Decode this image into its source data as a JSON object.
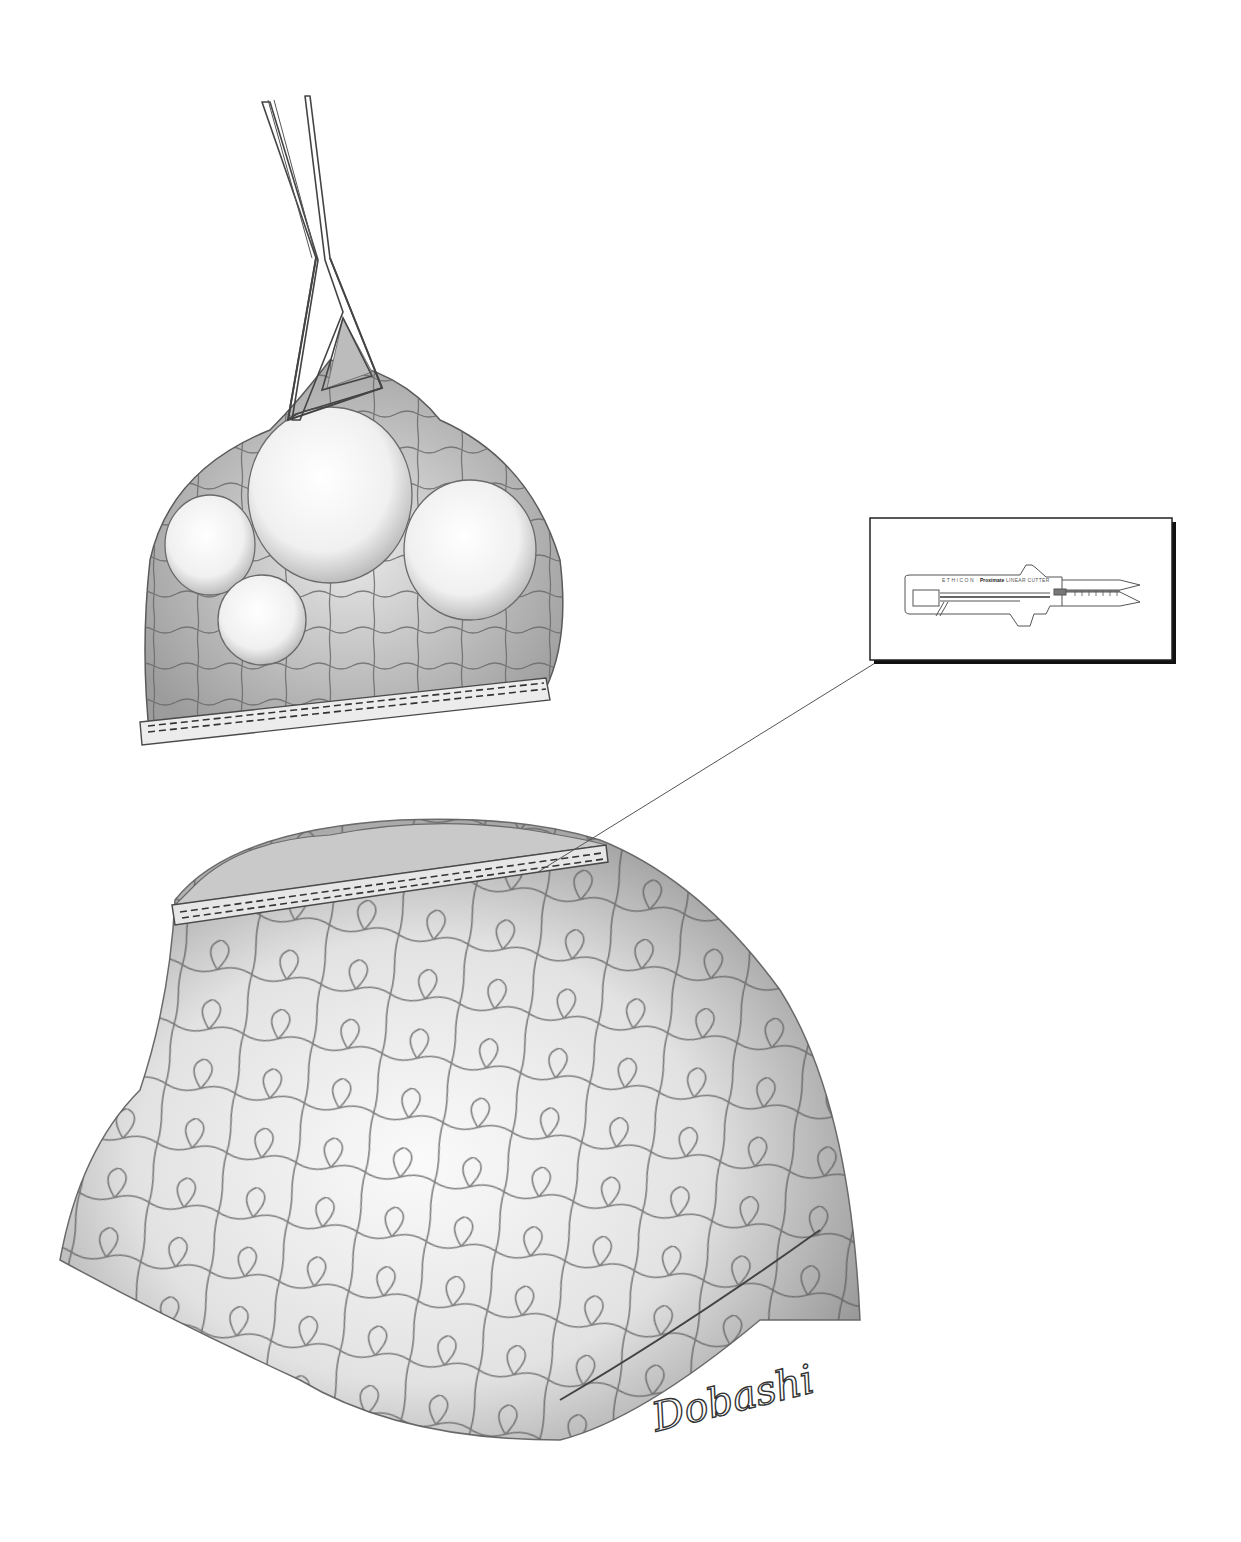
{
  "figure": {
    "background_color": "#ffffff",
    "ink_color": "#3a3a3a"
  },
  "resected_specimen": {
    "label": "resected-wedge-with-bullae",
    "bullae_count": 4,
    "staple_rows": 2
  },
  "forceps": {
    "label": "triangular-grasping-forceps"
  },
  "inset": {
    "brand": "ETHICON",
    "logo_text": "Proximate",
    "product": "LINEAR CUTTER",
    "frame_color": "#222222",
    "shadow_color": "#111111"
  },
  "lung_remnant": {
    "label": "lung-with-stapled-margin",
    "staple_rows": 2
  },
  "signature": {
    "text": "Dobashi"
  }
}
